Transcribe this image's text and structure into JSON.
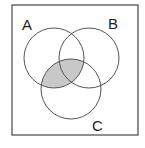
{
  "diagram": {
    "type": "venn",
    "universe": {
      "x": 12,
      "y": 5,
      "width": 126,
      "height": 130
    },
    "sets": [
      {
        "id": "A",
        "label": "A",
        "cx": 54,
        "cy": 58,
        "r": 30,
        "label_x": 22,
        "label_y": 30
      },
      {
        "id": "B",
        "label": "B",
        "cx": 89,
        "cy": 58,
        "r": 30,
        "label_x": 108,
        "label_y": 29
      },
      {
        "id": "C",
        "label": "C",
        "cx": 71,
        "cy": 89,
        "r": 30,
        "label_x": 92,
        "label_y": 131
      }
    ],
    "shaded_region": "A ∩ C",
    "colors": {
      "stroke": "#555555",
      "shade": "#c8c8c8",
      "background": "#ffffff"
    }
  }
}
